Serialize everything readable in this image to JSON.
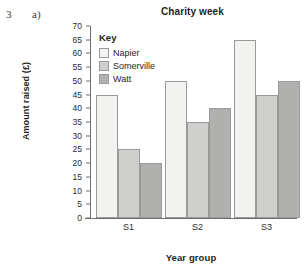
{
  "question": {
    "number": "3",
    "part": "a)"
  },
  "chart_data": {
    "type": "bar",
    "title": "Charity week",
    "xlabel": "Year group",
    "ylabel": "Amount raised (£)",
    "categories": [
      "S1",
      "S2",
      "S3"
    ],
    "series": [
      {
        "name": "Napier",
        "values": [
          45,
          50,
          65
        ],
        "color": "#f2f2f0"
      },
      {
        "name": "Somerville",
        "values": [
          25,
          35,
          45
        ],
        "color": "#cfcfcd"
      },
      {
        "name": "Watt",
        "values": [
          20,
          40,
          50
        ],
        "color": "#b0b0ae"
      }
    ],
    "ylim": [
      0,
      70
    ],
    "ytick_step": 5,
    "yticks": [
      0,
      5,
      10,
      15,
      20,
      25,
      30,
      35,
      40,
      45,
      50,
      55,
      60,
      65,
      70
    ],
    "grid": false,
    "legend": {
      "title": "Key",
      "position": "inside-top-left"
    }
  }
}
